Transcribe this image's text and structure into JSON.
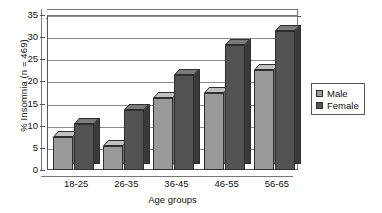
{
  "chart_data": {
    "type": "bar",
    "title": "",
    "xlabel": "Age groups",
    "ylabel": "% Insomnia (n = 469)",
    "categories": [
      "18-25",
      "26-35",
      "36-45",
      "46-55",
      "56-65"
    ],
    "series": [
      {
        "name": "Male",
        "values": [
          7.5,
          5.5,
          16.3,
          17.5,
          22.5
        ],
        "color": "#9a9a9a"
      },
      {
        "name": "Female",
        "values": [
          10.5,
          13.5,
          21.5,
          28.3,
          31.3
        ],
        "color": "#535353"
      }
    ],
    "ylim": [
      0,
      35
    ],
    "yticks": [
      0,
      5,
      10,
      15,
      20,
      25,
      30,
      35
    ],
    "ytick_labels": [
      "0",
      "5",
      "10",
      "15",
      "20",
      "25",
      "30",
      "35"
    ],
    "grid": true,
    "legend_position": "right",
    "style": "3d-clustered-column-grayscale"
  },
  "legend": {
    "items": [
      {
        "label": "Male"
      },
      {
        "label": "Female"
      }
    ]
  },
  "axes": {
    "y_title": "% Insomnia (n = 469)",
    "x_title": "Age groups"
  }
}
